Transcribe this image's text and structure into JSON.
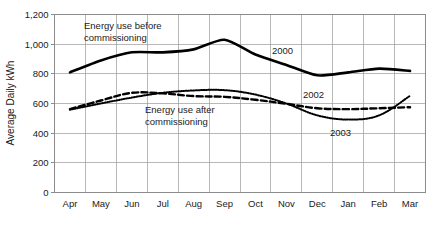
{
  "chart_data": {
    "type": "line",
    "title": "",
    "xlabel": "",
    "ylabel": "Average Daily kWh",
    "ylim": [
      0,
      1200
    ],
    "ytick_labels": [
      "0",
      "200",
      "400",
      "600",
      "800",
      "1,000",
      "1,200"
    ],
    "ytick_values": [
      0,
      200,
      400,
      600,
      800,
      1000,
      1200
    ],
    "grid": true,
    "legend_position": "inline-annotations",
    "categories": [
      "Apr",
      "May",
      "Jun",
      "Jul",
      "Aug",
      "Sep",
      "Oct",
      "Nov",
      "Dec",
      "Jan",
      "Feb",
      "Mar"
    ],
    "series": [
      {
        "name": "2000",
        "style": "solid",
        "color": "#000000",
        "values": [
          810,
          890,
          945,
          945,
          965,
          1030,
          930,
          860,
          790,
          810,
          835,
          820
        ]
      },
      {
        "name": "2002",
        "style": "dashed",
        "color": "#000000",
        "values": [
          562,
          620,
          672,
          668,
          650,
          645,
          625,
          598,
          568,
          562,
          568,
          575
        ]
      },
      {
        "name": "2003",
        "style": "dotted",
        "color": "#000000",
        "values": [
          558,
          600,
          640,
          672,
          688,
          690,
          660,
          600,
          520,
          492,
          520,
          652
        ]
      }
    ],
    "annotations": [
      {
        "id": "before",
        "lines": [
          "Energy use before",
          "commissioning"
        ],
        "x_px": 84,
        "y_px": 29
      },
      {
        "id": "after",
        "lines": [
          "Energy use after",
          "commissioning"
        ],
        "x_px": 145,
        "y_px": 113
      }
    ],
    "series_labels": [
      {
        "name": "2000",
        "x_px": 272,
        "y_px": 54
      },
      {
        "name": "2002",
        "x_px": 303,
        "y_px": 98
      },
      {
        "name": "2003",
        "x_px": 330,
        "y_px": 136
      }
    ]
  },
  "axes": {
    "y_title": "Average Daily kWh"
  }
}
